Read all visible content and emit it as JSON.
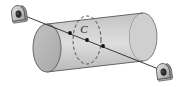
{
  "figure": {
    "name": "cylinder-with-axis-and-cross-section",
    "background_color": "#ffffff",
    "width": 183,
    "height": 87,
    "labels": {
      "cross_section": "C"
    },
    "colors": {
      "cylinder_body_light": "#dcdcdc",
      "cylinder_body_mid": "#cfcfcf",
      "cylinder_body_shade": "#bdbdbd",
      "end_cap_face": "#b6b6b6",
      "outline": "#555555",
      "dashed_stroke": "#4a4a4a",
      "axis_line": "#2b2b2b",
      "point_fill": "#111111",
      "lug_body": "#c9c9c9",
      "lug_shade": "#9a9a9a",
      "lug_hole": "#2a2a2a",
      "label_color": "#1a1a1a"
    },
    "geometry": {
      "cylinder": {
        "left_cap_center": [
          47,
          48
        ],
        "left_cap_rx": 14,
        "left_cap_ry": 24,
        "right_cap_center": [
          143,
          37
        ],
        "right_cap_rx": 14,
        "right_cap_ry": 24,
        "axis_tilt_degrees": -6.5
      },
      "cross_section_ellipse": {
        "center": [
          87,
          40
        ],
        "rx": 14,
        "ry": 24,
        "dashed": true,
        "label_offset": [
          -2,
          -8
        ]
      },
      "axis_line": {
        "start": [
          18,
          13
        ],
        "end": [
          163,
          71
        ],
        "stroke_width": 1
      },
      "points": [
        {
          "name": "entry-point",
          "x": 70,
          "y": 33
        },
        {
          "name": "center-point",
          "x": 87,
          "y": 40
        },
        {
          "name": "exit-point",
          "x": 103,
          "y": 46
        }
      ],
      "anchors": [
        {
          "name": "upper-left-lug",
          "x": 18,
          "y": 13
        },
        {
          "name": "lower-right-lug",
          "x": 163,
          "y": 71
        }
      ]
    }
  }
}
